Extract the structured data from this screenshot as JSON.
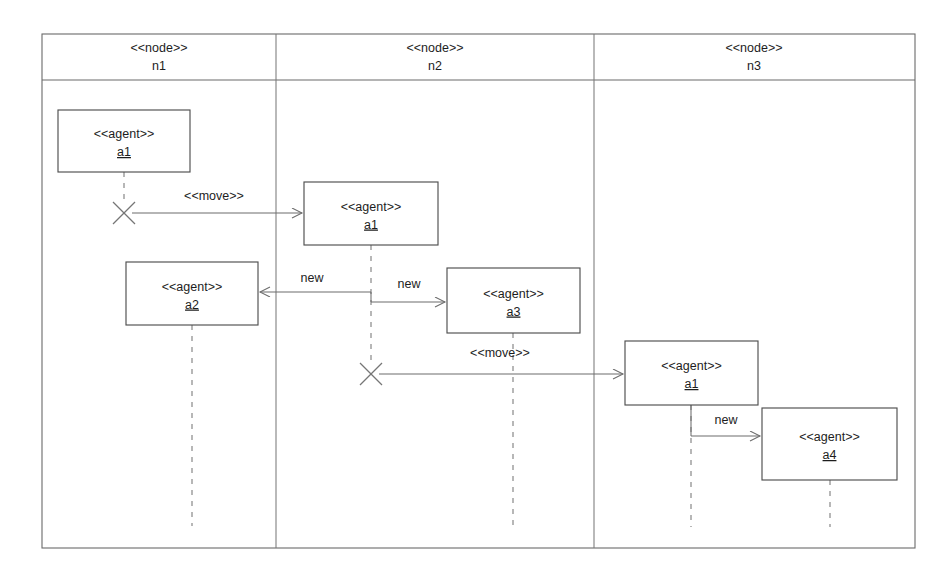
{
  "diagram": {
    "stereotype_node": "<<node>>",
    "stereotype_agent": "<<agent>>",
    "frame": {
      "x": 42,
      "y": 34,
      "width": 873,
      "height": 514
    },
    "header_row_bottom": 80,
    "column_dividers": [
      276,
      594
    ],
    "nodes": [
      {
        "id": "n1",
        "stereotype": "<<node>>",
        "name": "n1",
        "label_cx": 159,
        "col_left": 42,
        "col_right": 276
      },
      {
        "id": "n2",
        "stereotype": "<<node>>",
        "name": "n2",
        "label_cx": 435,
        "col_left": 276,
        "col_right": 594
      },
      {
        "id": "n3",
        "stereotype": "<<node>>",
        "name": "n3",
        "label_cx": 754,
        "col_left": 594,
        "col_right": 915
      }
    ],
    "agents": [
      {
        "id": "a1-n1",
        "stereotype": "<<agent>>",
        "name": "a1",
        "x": 58,
        "y": 110,
        "width": 132,
        "height": 62,
        "node": "n1"
      },
      {
        "id": "a1-n2",
        "stereotype": "<<agent>>",
        "name": "a1",
        "x": 304,
        "y": 182,
        "width": 134,
        "height": 63,
        "node": "n2"
      },
      {
        "id": "a2-n1",
        "stereotype": "<<agent>>",
        "name": "a2",
        "x": 126,
        "y": 262,
        "width": 132,
        "height": 63,
        "node": "n1"
      },
      {
        "id": "a3-n2",
        "stereotype": "<<agent>>",
        "name": "a3",
        "x": 447,
        "y": 268,
        "width": 133,
        "height": 65,
        "node": "n2"
      },
      {
        "id": "a1-n3",
        "stereotype": "<<agent>>",
        "name": "a1",
        "x": 625,
        "y": 341,
        "width": 133,
        "height": 64,
        "node": "n3"
      },
      {
        "id": "a4-n3",
        "stereotype": "<<agent>>",
        "name": "a4",
        "x": 762,
        "y": 408,
        "width": 135,
        "height": 72,
        "node": "n3"
      }
    ],
    "lifelines": [
      {
        "id": "ll-a1-n1",
        "x": 124,
        "y1": 172,
        "y2": 205,
        "agent": "a1-n1"
      },
      {
        "id": "ll-a1-n2",
        "x": 371,
        "y1": 245,
        "y2": 366,
        "agent": "a1-n2"
      },
      {
        "id": "ll-a2-n1",
        "x": 192,
        "y1": 325,
        "y2": 526,
        "agent": "a2-n1"
      },
      {
        "id": "ll-a3-n2",
        "x": 513,
        "y1": 333,
        "y2": 526,
        "agent": "a3-n2"
      },
      {
        "id": "ll-a1-n3",
        "x": 691,
        "y1": 405,
        "y2": 527,
        "agent": "a1-n3"
      },
      {
        "id": "ll-a4-n3",
        "x": 830,
        "y1": 480,
        "y2": 527,
        "agent": "a4-n3"
      }
    ],
    "terminations": [
      {
        "id": "x-a1-n1",
        "cx": 124,
        "cy": 213,
        "size": 11,
        "agent": "a1-n1"
      },
      {
        "id": "x-a1-n2",
        "cx": 371,
        "cy": 374,
        "size": 11,
        "agent": "a1-n2"
      }
    ],
    "messages": [
      {
        "id": "msg-move-1",
        "label": "<<move>>",
        "kind": "move",
        "from": "a1-n1",
        "to": "a1-n2",
        "x1": 132,
        "y1": 213,
        "x2": 302,
        "y2": 213,
        "label_x": 214,
        "label_y": 200
      },
      {
        "id": "msg-new-a2",
        "label": "new",
        "kind": "new",
        "from": "a1-n2",
        "to": "a2-n1",
        "x1": 371,
        "y1": 292,
        "x2": 260,
        "y2": 292,
        "label_x": 312,
        "label_y": 282
      },
      {
        "id": "msg-new-a3",
        "label": "new",
        "kind": "new",
        "from": "a1-n2",
        "to": "a3-n2",
        "x1": 371,
        "y1": 302,
        "x2": 445,
        "y2": 302,
        "label_x": 409,
        "label_y": 288
      },
      {
        "id": "msg-move-2",
        "label": "<<move>>",
        "kind": "move",
        "from": "a1-n2",
        "to": "a1-n3",
        "x1": 379,
        "y1": 374,
        "x2": 623,
        "y2": 374,
        "label_x": 500,
        "label_y": 357
      },
      {
        "id": "msg-new-a4",
        "label": "new",
        "kind": "new",
        "from": "a1-n3",
        "to": "a4-n3",
        "x1": 691,
        "y1": 436,
        "x2": 760,
        "y2": 436,
        "label_x": 726,
        "label_y": 424
      }
    ],
    "colors": {
      "frame_stroke": "#6a6a6a",
      "box_stroke": "#4f4f4f",
      "lifeline_stroke": "#8c8c8c",
      "message_stroke": "#6d6d6d",
      "text": "#1d1d1d",
      "background": "#ffffff"
    }
  }
}
